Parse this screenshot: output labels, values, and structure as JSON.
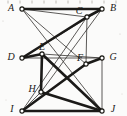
{
  "figure": {
    "kind": "graph-diagram",
    "width": 127,
    "height": 116,
    "background_color": "#fbfbfa",
    "ink_color": "#1a1917",
    "thin_edge_color": "#33312e",
    "thick_edge_color": "#1b1a18",
    "vertex_fill_color": "#ffffff"
  },
  "vertices": [
    {
      "id": "A",
      "label": "A",
      "x": 22,
      "y": 9,
      "label_x": 11,
      "label_y": 9
    },
    {
      "id": "B",
      "label": "B",
      "x": 102,
      "y": 9,
      "label_x": 113,
      "label_y": 9
    },
    {
      "id": "C",
      "label": "C",
      "x": 87,
      "y": 17,
      "label_x": 79,
      "label_y": 12
    },
    {
      "id": "D",
      "label": "D",
      "x": 22,
      "y": 58,
      "label_x": 11,
      "label_y": 58
    },
    {
      "id": "E",
      "label": "E",
      "x": 42,
      "y": 54,
      "label_x": 42,
      "label_y": 48
    },
    {
      "id": "F",
      "label": "F",
      "x": 86,
      "y": 64,
      "label_x": 80,
      "label_y": 59
    },
    {
      "id": "G",
      "label": "G",
      "x": 102,
      "y": 58,
      "label_x": 113,
      "label_y": 58
    },
    {
      "id": "H",
      "label": "H",
      "x": 41,
      "y": 92,
      "label_x": 32,
      "label_y": 90
    },
    {
      "id": "I",
      "label": "I",
      "x": 22,
      "y": 111,
      "label_x": 12,
      "label_y": 110
    },
    {
      "id": "J",
      "label": "J",
      "x": 102,
      "y": 111,
      "label_x": 113,
      "label_y": 110
    }
  ],
  "edges": [
    {
      "from": "A",
      "to": "B",
      "weight": "thick"
    },
    {
      "from": "A",
      "to": "C",
      "weight": "thin"
    },
    {
      "from": "A",
      "to": "F",
      "weight": "thin"
    },
    {
      "from": "A",
      "to": "J",
      "weight": "thin"
    },
    {
      "from": "B",
      "to": "C",
      "weight": "thick"
    },
    {
      "from": "B",
      "to": "D",
      "weight": "thin"
    },
    {
      "from": "B",
      "to": "H",
      "weight": "thin"
    },
    {
      "from": "C",
      "to": "D",
      "weight": "thick"
    },
    {
      "from": "C",
      "to": "F",
      "weight": "thin"
    },
    {
      "from": "C",
      "to": "I",
      "weight": "thin"
    },
    {
      "from": "D",
      "to": "E",
      "weight": "thick"
    },
    {
      "from": "D",
      "to": "G",
      "weight": "thin"
    },
    {
      "from": "E",
      "to": "G",
      "weight": "thin"
    },
    {
      "from": "E",
      "to": "H",
      "weight": "thick"
    },
    {
      "from": "E",
      "to": "J",
      "weight": "thick"
    },
    {
      "from": "F",
      "to": "G",
      "weight": "thick"
    },
    {
      "from": "F",
      "to": "I",
      "weight": "thick"
    },
    {
      "from": "G",
      "to": "J",
      "weight": "thin"
    },
    {
      "from": "H",
      "to": "I",
      "weight": "thin"
    },
    {
      "from": "H",
      "to": "J",
      "weight": "thick"
    },
    {
      "from": "I",
      "to": "J",
      "weight": "thick"
    }
  ],
  "scan_artifacts": {
    "top_ticks_y": 2,
    "top_ticks_x": [
      8,
      20,
      32,
      44,
      56,
      68,
      80,
      92,
      104,
      116
    ],
    "specks": [
      {
        "x": 3,
        "y": 21,
        "r": 0.6
      },
      {
        "x": 120,
        "y": 34,
        "r": 0.6
      },
      {
        "x": 6,
        "y": 100,
        "r": 0.5
      },
      {
        "x": 122,
        "y": 94,
        "r": 0.5
      }
    ]
  }
}
